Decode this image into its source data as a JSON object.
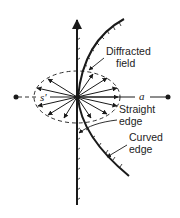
{
  "diagram": {
    "type": "edge-diffraction-schematic",
    "labels": {
      "diffracted_field_line1": "Diffracted",
      "diffracted_field_line2": "field",
      "straight_edge_line1": "Straight",
      "straight_edge_line2": "edge",
      "curved_edge_line1": "Curved",
      "curved_edge_line2": "edge",
      "s_prime": "s'",
      "a": "a"
    },
    "elements": [
      "straight-edge (vertical line with hatching, arrow at top)",
      "curved-edge (arc with hatching)",
      "diffraction-point at center",
      "dashed ellipse (cone of diffracted rays)",
      "radial ray arrows from diffraction point",
      "dashed axis with end dots labeled s' and a"
    ],
    "colors": {
      "ink": "#1a1a1a",
      "background": "#ffffff"
    }
  }
}
